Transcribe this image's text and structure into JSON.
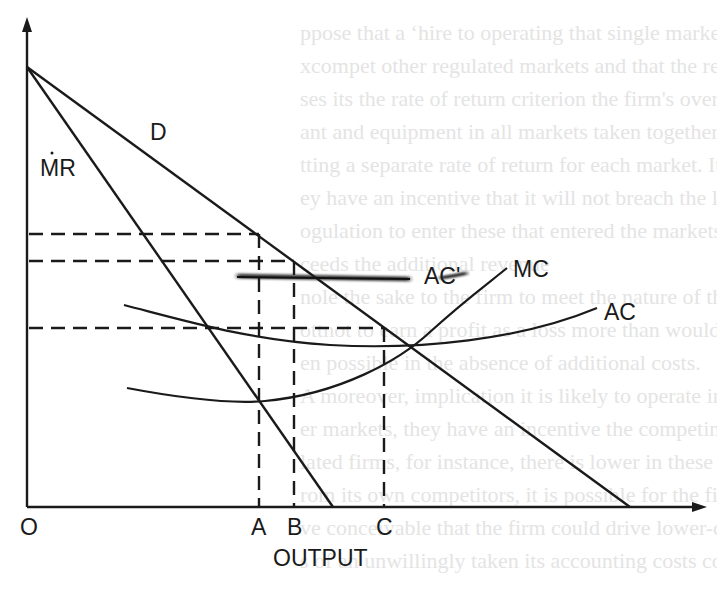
{
  "chart_data": {
    "type": "line",
    "title": "",
    "xlabel": "OUTPUT",
    "ylabel": "",
    "origin_label": "O",
    "x_ticks": [
      "A",
      "B",
      "C"
    ],
    "curves": [
      {
        "name": "D",
        "label": "D",
        "kind": "straight",
        "description": "Demand curve, linear, from vertical intercept to x-axis beyond C"
      },
      {
        "name": "MR",
        "label": "MR",
        "kind": "straight",
        "description": "Marginal revenue, linear, same vertical intercept as D, steeper, hits x-axis just past B"
      },
      {
        "name": "MC",
        "label": "MC",
        "kind": "curve",
        "description": "Marginal cost, U-shaped, minimum near A, rising steeply"
      },
      {
        "name": "AC",
        "label": "AC",
        "kind": "curve",
        "description": "Average cost, U-shaped, flatter, minimum between B and C"
      },
      {
        "name": "AC'",
        "label": "AC'",
        "kind": "horizontal",
        "description": "Shifted average cost, horizontal (blurred) line"
      }
    ],
    "guides": [
      {
        "from_axis": "y",
        "to_x": "A",
        "style": "dashed",
        "note": "price at output A on D"
      },
      {
        "from_axis": "y",
        "to_x": "B",
        "style": "dashed",
        "note": "price at output B on D"
      },
      {
        "from_axis": "y",
        "to_x": "C",
        "style": "dashed",
        "note": "price/cost at output C"
      }
    ]
  },
  "labels": {
    "D": "D",
    "MR": "MR",
    "MC": "MC",
    "AC": "AC",
    "ACprime": "AC'",
    "O": "O",
    "A": "A",
    "B": "B",
    "C": "C",
    "xlabel": "OUTPUT"
  },
  "bleed_text": [
    "ppose that a ʻhire to operating that single market, the firm c",
    "xcompet other regulated markets and that the regulatory com",
    "ses its the rate of return criterion the firm's overall value",
    "ant and equipment in all markets taken together rather than",
    "tting a separate rate of return for each market. It mus",
    "ey have an incentive that it will not breach the license",
    "ogulation to enter these that entered the markets to ",
    "ceeds the additional revenue",
    "nole the sake to the firm to meet the nature of the regulation",
    "ottnot to earn a profit as a loss more than would ",
    "en possible in the absence of additional costs.",
    "  A moreover, implication it is likely to operate in non-regulated",
    "er markets, they have an incentive the competing firms. Th",
    "lated firms, for instance, there is lower in these sectors",
    "rom its own competitors, it is possible for the firm",
    "ve conceivable that the firm could drive lower-cost produce",
    "s of an unwillingly taken its accounting costs could exceed the"
  ]
}
